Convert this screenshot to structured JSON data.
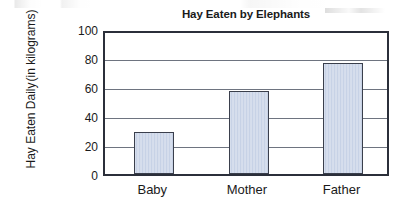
{
  "chart_data": {
    "type": "bar",
    "title": "Hay Eaten by Elephants",
    "xlabel": "",
    "ylabel": "Hay Eaten Daily (in kilograms)",
    "ylabel_lines": [
      "Hay Eaten Daily",
      "(in kilograms)"
    ],
    "categories": [
      "Baby",
      "Mother",
      "Father"
    ],
    "values": [
      30,
      59,
      79
    ],
    "ylim": [
      0,
      100
    ],
    "ytick_labels": [
      "0",
      "20",
      "40",
      "60",
      "80",
      "100"
    ],
    "ytick_values": [
      0,
      20,
      40,
      60,
      80,
      100
    ],
    "grid": true,
    "legend": false,
    "legend_position": "none",
    "bar_fill_color": "#c7d2e6",
    "bar_border_color": "#3a3f4c",
    "axis_color": "#2b2f3a",
    "gridline_color": "#6e7480",
    "background_color": "#ffffff"
  }
}
